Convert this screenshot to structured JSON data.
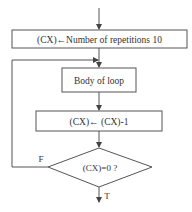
{
  "diagram": {
    "type": "flowchart",
    "title": "",
    "nodes": [
      {
        "id": "init",
        "shape": "rectangle",
        "label": "(CX)←Number of repetitions 10"
      },
      {
        "id": "body",
        "shape": "rectangle",
        "label": "Body of loop"
      },
      {
        "id": "dec",
        "shape": "rectangle",
        "label": "(CX)← (CX)-1"
      },
      {
        "id": "test",
        "shape": "diamond",
        "label": "(CX)=0 ?"
      }
    ],
    "edges": [
      {
        "from": "start",
        "to": "init",
        "label": ""
      },
      {
        "from": "init",
        "to": "body",
        "label": ""
      },
      {
        "from": "body",
        "to": "dec",
        "label": ""
      },
      {
        "from": "dec",
        "to": "test",
        "label": ""
      },
      {
        "from": "test",
        "to": "body",
        "label": "F"
      },
      {
        "from": "test",
        "to": "exit",
        "label": "T"
      }
    ],
    "labels": {
      "false_branch": "F",
      "true_branch": "T"
    },
    "colors": {
      "stroke": "#555555",
      "text": "#333333",
      "background": "#ffffff"
    }
  }
}
